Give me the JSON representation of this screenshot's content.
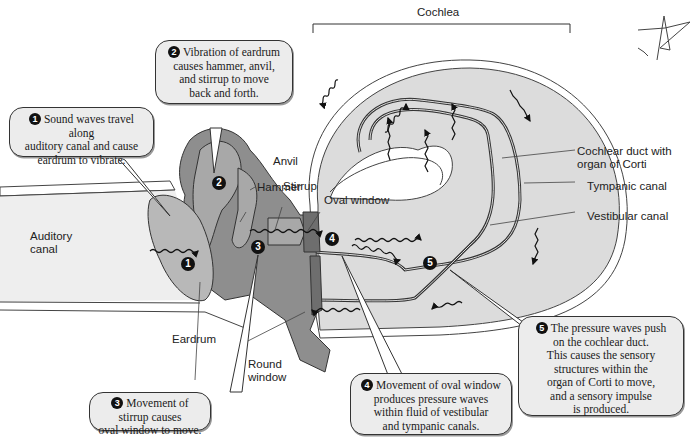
{
  "title_label": "Cochlea",
  "labels": {
    "hammer": "Hammer",
    "anvil": "Anvil",
    "stirrup": "Stirrup",
    "oval_window": "Oval window",
    "auditory_canal_1": "Auditory",
    "auditory_canal_2": "canal",
    "eardrum": "Eardrum",
    "round_window_1": "Round",
    "round_window_2": "window",
    "cochlear_duct_1": "Cochlear duct with",
    "cochlear_duct_2": "organ of Corti",
    "tympanic_canal": "Tympanic canal",
    "vestibular_canal": "Vestibular canal"
  },
  "steps": [
    {
      "number": "1",
      "lines": [
        "Sound waves travel along",
        "auditory canal and cause",
        "eardrum to vibrate."
      ]
    },
    {
      "number": "2",
      "lines": [
        "Vibration of eardrum",
        "causes hammer, anvil,",
        "and stirrup to move",
        "back and forth."
      ]
    },
    {
      "number": "3",
      "lines": [
        "Movement of stirrup causes",
        "oval window to move."
      ]
    },
    {
      "number": "4",
      "lines": [
        "Movement of oval window",
        "produces pressure waves",
        "within fluid of vestibular",
        "and tympanic canals."
      ]
    },
    {
      "number": "5",
      "lines": [
        "The pressure waves push",
        "on the cochlear duct.",
        "This causes the sensory",
        "structures within the",
        "organ of Corti to move,",
        "and a sensory impulse",
        "is produced."
      ]
    }
  ],
  "colors": {
    "bone": "#8e8e8e",
    "bone_light": "#a8a8a8",
    "fluid": "#dcdcdc",
    "canal": "#eeeeee",
    "callout_bg": "#ececec",
    "outline": "#333333"
  }
}
